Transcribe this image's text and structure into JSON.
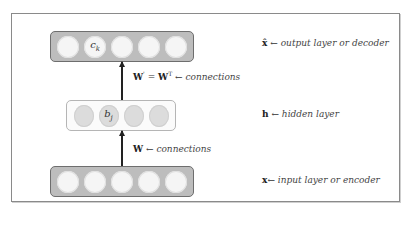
{
  "diagram": {
    "output_layer": {
      "node_count": 5,
      "labeled_node_index": 1,
      "node_label": "c",
      "node_label_subscript": "k",
      "symbol": "x̂",
      "arrow": "←",
      "description": "output layer or  decoder"
    },
    "hidden_layer": {
      "node_count": 4,
      "labeled_node_index": 1,
      "node_label": "b",
      "node_label_subscript": "j",
      "symbol": "h",
      "arrow": "←",
      "description": "hidden layer"
    },
    "input_layer": {
      "node_count": 5,
      "symbol": "x",
      "arrow": "←",
      "description": "input layer or encoder"
    },
    "upper_connection": {
      "lhs": "W",
      "lhs_sup": "'",
      "equals": "=",
      "rhs": "W",
      "rhs_sup": "T",
      "arrow": "←",
      "description": "connections"
    },
    "lower_connection": {
      "lhs": "W",
      "arrow": "←",
      "description": "connections"
    },
    "colors": {
      "dark_layer_fill": "#bdbdbd",
      "dark_layer_border": "#6e6e6e",
      "light_layer_fill": "#fbfbfb",
      "white_node": "#f5f5f5",
      "grey_node": "#dcdcdc",
      "frame_border": "#8a8a8a",
      "arrow": "#222222"
    }
  }
}
